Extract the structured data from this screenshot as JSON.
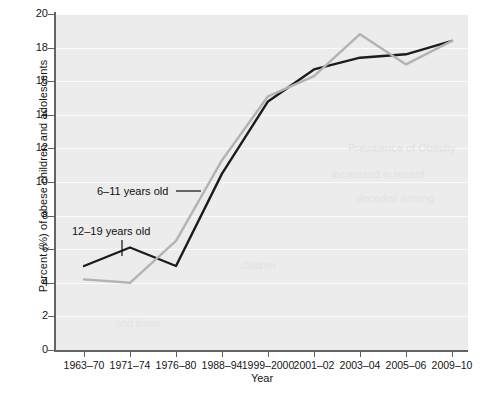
{
  "chart_data": {
    "type": "line",
    "title": "",
    "xlabel": "Year",
    "ylabel": "Percent (%) of obese children and adolescents",
    "categories": [
      "1963–70",
      "1971–74",
      "1976–80",
      "1988–94",
      "1999–2000",
      "2001–02",
      "2003–04",
      "2005–06",
      "2009–10"
    ],
    "ylim": [
      0,
      20
    ],
    "ytick_values": [
      0,
      2,
      4,
      6,
      8,
      10,
      12,
      14,
      16,
      18,
      20
    ],
    "ytick_labels": [
      "0",
      "2",
      "4",
      "6",
      "8",
      "10",
      "12",
      "14",
      "16",
      "18",
      "20"
    ],
    "grid": "horizontal-white-on-gray",
    "legend_position": "inline-annotations",
    "series": [
      {
        "name": "6–11 years old",
        "color": "#b3b3b3",
        "values": [
          4.2,
          4.0,
          6.5,
          11.3,
          15.1,
          16.3,
          18.8,
          17.0,
          18.4
        ]
      },
      {
        "name": "12–19 years old",
        "color": "#1c1c1c",
        "values": [
          5.0,
          6.1,
          5.0,
          10.5,
          14.8,
          16.7,
          17.4,
          17.6,
          18.4
        ]
      }
    ],
    "annotations": [
      {
        "text": "6–11 years old",
        "leader": "horizontal-line-right",
        "target_category": "1988–94"
      },
      {
        "text": "12–19 years old",
        "leader": "vertical-line-down",
        "target_category": "1971–74"
      }
    ]
  },
  "axes": {
    "y_title": "Percent (%) of obese children and adolescents",
    "x_title": "Year"
  },
  "ghost_text": {
    "line1": "Prevalence of Obesity",
    "line2": "increased in recent",
    "line3": "decades among",
    "line4": "children",
    "line5": "and teens"
  },
  "colors": {
    "plot_background": "#ececec",
    "gridline": "#fbfbfb",
    "axis": "#636363",
    "series_6_11": "#b3b3b3",
    "series_12_19": "#1c1c1c",
    "page_background": "#ffffff"
  }
}
